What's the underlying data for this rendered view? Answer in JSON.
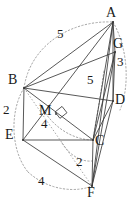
{
  "figure": {
    "stroke_color": "#3a3a3a",
    "dotted_color": "#9a9a9a",
    "text_color": "#1a1a1a",
    "background": "#ffffff"
  },
  "vertices": [
    {
      "id": "A",
      "label": "A",
      "x": 113,
      "y": 22,
      "label_x": 106,
      "label_y": 6
    },
    {
      "id": "G",
      "label": "G",
      "x": 115,
      "y": 52,
      "label_x": 113,
      "label_y": 37
    },
    {
      "id": "B",
      "label": "B",
      "x": 24,
      "y": 88,
      "label_x": 8,
      "label_y": 73
    },
    {
      "id": "D",
      "label": "D",
      "x": 113,
      "y": 101,
      "label_x": 115,
      "label_y": 93
    },
    {
      "id": "M",
      "label": "M",
      "x": 56,
      "y": 114,
      "label_x": 39,
      "label_y": 104
    },
    {
      "id": "E",
      "label": "E",
      "x": 23,
      "y": 140,
      "label_x": 5,
      "label_y": 128
    },
    {
      "id": "C",
      "label": "C",
      "x": 93,
      "y": 140,
      "label_x": 95,
      "label_y": 134
    },
    {
      "id": "F",
      "label": "F",
      "x": 92,
      "y": 186,
      "label_x": 87,
      "label_y": 186
    }
  ],
  "measure_labels": [
    {
      "id": "BA-5",
      "text": "5",
      "x": 57,
      "y": 27
    },
    {
      "id": "mid-5",
      "text": "5",
      "x": 87,
      "y": 73
    },
    {
      "id": "GD-3",
      "text": "3",
      "x": 117,
      "y": 55
    },
    {
      "id": "BE-2",
      "text": "2",
      "x": 3,
      "y": 103
    },
    {
      "id": "M-4",
      "text": "4",
      "x": 41,
      "y": 117
    },
    {
      "id": "CF-2",
      "text": "2",
      "x": 76,
      "y": 155
    },
    {
      "id": "EF-4",
      "text": "4",
      "x": 38,
      "y": 174
    }
  ],
  "solid_edges": [
    {
      "id": "B-A",
      "from": "B",
      "to": "A"
    },
    {
      "id": "B-G",
      "from": "B",
      "to": "G"
    },
    {
      "id": "B-C",
      "from": "B",
      "to": "C"
    },
    {
      "id": "B-E",
      "from": "B",
      "to": "E"
    },
    {
      "id": "B-D",
      "from": "B",
      "to": "D"
    },
    {
      "id": "A-G",
      "from": "A",
      "to": "G"
    },
    {
      "id": "A-D",
      "from": "A",
      "to": "D"
    },
    {
      "id": "A-C",
      "from": "A",
      "to": "C"
    },
    {
      "id": "A-F",
      "from": "A",
      "to": "F"
    },
    {
      "id": "G-D",
      "from": "G",
      "to": "D"
    },
    {
      "id": "G-C",
      "from": "G",
      "to": "C"
    },
    {
      "id": "G-F",
      "from": "G",
      "to": "F"
    },
    {
      "id": "D-C",
      "from": "D",
      "to": "C"
    },
    {
      "id": "D-F",
      "from": "D",
      "to": "F"
    },
    {
      "id": "C-F",
      "from": "C",
      "to": "F"
    },
    {
      "id": "E-C",
      "from": "E",
      "to": "C"
    },
    {
      "id": "E-F",
      "from": "E",
      "to": "F"
    },
    {
      "id": "E-A",
      "from": "E",
      "to": "A"
    }
  ],
  "hidden_edges": [
    {
      "id": "B-F-hidden",
      "from": "B",
      "to": "F"
    }
  ],
  "right_angle": {
    "id": "right-angle-at-M",
    "x": 56,
    "y": 114,
    "size": 9
  },
  "arcs": [
    {
      "id": "arc-top",
      "d": "M 24 88 C 30 46 70 20 113 22"
    },
    {
      "id": "arc-right",
      "d": "M 113 22 C 128 48 130 86 120 110"
    },
    {
      "id": "arc-left",
      "d": "M 24 88 C 10 110 10 150 28 172"
    },
    {
      "id": "arc-bottom",
      "d": "M 28 172 C 50 192 78 192 92 186"
    },
    {
      "id": "arc-inner-b",
      "d": "M 40 104 C 52 128 74 140 93 140"
    },
    {
      "id": "arc-inner-c",
      "d": "M 93 140 C 96 120 100 100 104 70"
    },
    {
      "id": "arc-inner-d",
      "d": "M 62 143 C 70 156 82 162 92 161"
    }
  ]
}
